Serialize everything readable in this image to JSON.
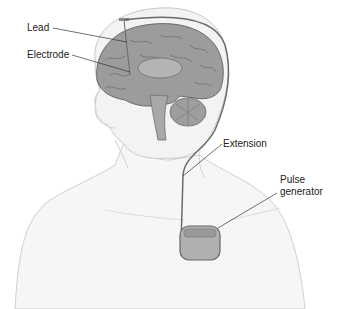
{
  "diagram": {
    "labels": {
      "lead": "Lead",
      "electrode": "Electrode",
      "extension": "Extension",
      "pulse_generator_line1": "Pulse",
      "pulse_generator_line2": "generator"
    },
    "colors": {
      "brain": "#9a9a9a",
      "brain_fold": "#6e6e6e",
      "skin_outline": "#c8c8c8",
      "skin_fill": "#f4f4f4",
      "wire": "#6a6a6a",
      "device": "#a8a8a8",
      "text": "#222222"
    }
  }
}
